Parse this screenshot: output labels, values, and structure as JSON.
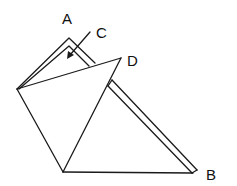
{
  "diagram": {
    "type": "geometric-figure",
    "labels": [
      {
        "id": "A",
        "text": "A",
        "x": 62,
        "y": 24
      },
      {
        "id": "B",
        "text": "B",
        "x": 206,
        "y": 180
      },
      {
        "id": "C",
        "text": "C",
        "x": 96,
        "y": 38
      },
      {
        "id": "D",
        "text": "D",
        "x": 127,
        "y": 66
      }
    ],
    "stroke_color": "#1a1a1a",
    "background": "#ffffff"
  }
}
